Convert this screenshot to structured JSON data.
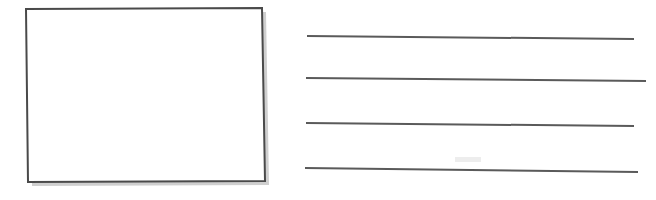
{
  "canvas": {
    "width": 656,
    "height": 200,
    "background_color": "#ffffff",
    "style": "hand-drawn-sketch-wireframe",
    "title": "Image placeholder with text lines wireframe"
  },
  "palette": {
    "stroke_color": "#4a4a4a",
    "line_color": "#5a5a5a",
    "shadow_color": "#cfcfcf",
    "fill_color": "#ffffff",
    "faint_mark_color": "#ededed"
  },
  "image_placeholder": {
    "name": "image-placeholder-box",
    "label": "",
    "fill": "#ffffff",
    "stroke": "#4a4a4a",
    "stroke_width": 2,
    "corners": {
      "top_left": [
        26,
        9
      ],
      "top_right": [
        262,
        8
      ],
      "bottom_right": [
        265,
        181
      ],
      "bottom_left": [
        28,
        182
      ]
    },
    "shadow": {
      "offset_x": 4,
      "offset_y": 4,
      "color": "#cfcfcf"
    }
  },
  "text_lines": {
    "name": "text-placeholder-lines",
    "count": 4,
    "stroke": "#5a5a5a",
    "stroke_width": 2,
    "items": [
      {
        "index": 1,
        "label": "text-line-1",
        "x1": 307,
        "y1": 36,
        "x2": 634,
        "y2": 39
      },
      {
        "index": 2,
        "label": "text-line-2",
        "x1": 306,
        "y1": 78,
        "x2": 646,
        "y2": 81
      },
      {
        "index": 3,
        "label": "text-line-3",
        "x1": 306,
        "y1": 123,
        "x2": 634,
        "y2": 126
      },
      {
        "index": 4,
        "label": "text-line-4",
        "x1": 305,
        "y1": 168,
        "x2": 638,
        "y2": 172
      }
    ]
  },
  "faint_marks": [
    {
      "name": "faint-smudge-above-line-4",
      "x": 455,
      "y": 157,
      "width": 26,
      "height": 5,
      "color": "#ededed"
    }
  ],
  "accessibility": {
    "image_region_label": "Image placeholder",
    "text_region_label": "Text lines placeholder"
  }
}
